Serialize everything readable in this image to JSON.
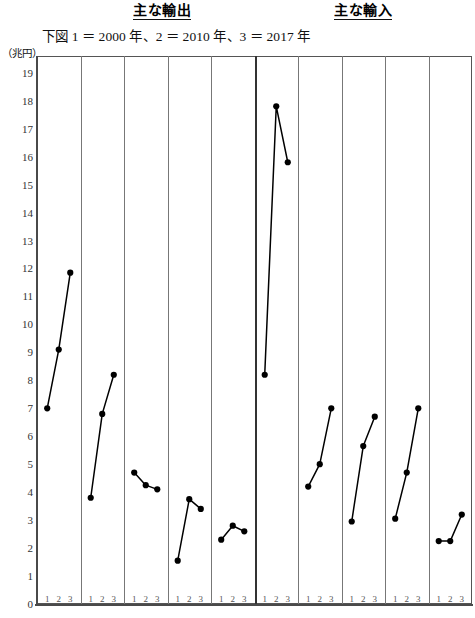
{
  "header": {
    "export_label": "主な輸出",
    "import_label": "主な輸入",
    "subnote": "下図 1 ＝ 2000 年、2 ＝ 2010 年、3 ＝ 2017 年",
    "unit_label": "（兆円）"
  },
  "chart_data": {
    "type": "line",
    "subtitle": "下図 1 ＝ 2000 年、2 ＝ 2010 年、3 ＝ 2017 年",
    "xlabel": "",
    "ylabel": "（兆円）",
    "ylim": [
      0,
      19.6
    ],
    "yticks": [
      0,
      1,
      2,
      3,
      4,
      5,
      6,
      7,
      8,
      9,
      10,
      11,
      12,
      13,
      14,
      15,
      16,
      17,
      18,
      19
    ],
    "grid": false,
    "legend": "none",
    "x": [
      "1",
      "2",
      "3"
    ],
    "x_meaning": [
      "2000年",
      "2010年",
      "2017年"
    ],
    "panel_tick_labels": [
      "1",
      "2",
      "3"
    ],
    "groups": [
      {
        "name": "主な輸出",
        "panels": [
          {
            "index": 1,
            "values": [
              7.0,
              9.1,
              11.85
            ]
          },
          {
            "index": 2,
            "values": [
              3.8,
              6.8,
              8.2
            ]
          },
          {
            "index": 3,
            "values": [
              4.7,
              4.25,
              4.1
            ]
          },
          {
            "index": 4,
            "values": [
              1.55,
              3.75,
              3.4
            ]
          },
          {
            "index": 5,
            "values": [
              2.3,
              2.8,
              2.6
            ]
          }
        ]
      },
      {
        "name": "主な輸入",
        "panels": [
          {
            "index": 6,
            "values": [
              8.2,
              17.8,
              15.8
            ]
          },
          {
            "index": 7,
            "values": [
              4.2,
              5.0,
              7.0
            ]
          },
          {
            "index": 8,
            "values": [
              2.95,
              5.65,
              6.7
            ]
          },
          {
            "index": 9,
            "values": [
              3.05,
              4.7,
              7.0
            ]
          },
          {
            "index": 10,
            "values": [
              2.25,
              2.25,
              3.2
            ]
          }
        ]
      }
    ],
    "series": [
      {
        "name": "panel-1",
        "values": [
          7.0,
          9.1,
          11.85
        ]
      },
      {
        "name": "panel-2",
        "values": [
          3.8,
          6.8,
          8.2
        ]
      },
      {
        "name": "panel-3",
        "values": [
          4.7,
          4.25,
          4.1
        ]
      },
      {
        "name": "panel-4",
        "values": [
          1.55,
          3.75,
          3.4
        ]
      },
      {
        "name": "panel-5",
        "values": [
          2.3,
          2.8,
          2.6
        ]
      },
      {
        "name": "panel-6",
        "values": [
          8.2,
          17.8,
          15.8
        ]
      },
      {
        "name": "panel-7",
        "values": [
          4.2,
          5.0,
          7.0
        ]
      },
      {
        "name": "panel-8",
        "values": [
          2.95,
          5.65,
          6.7
        ]
      },
      {
        "name": "panel-9",
        "values": [
          3.05,
          4.7,
          7.0
        ]
      },
      {
        "name": "panel-10",
        "values": [
          2.25,
          2.25,
          3.2
        ]
      }
    ],
    "colors": {
      "line": "#000000",
      "marker": "#000000",
      "frame": "#555555",
      "divider": "#777777"
    }
  }
}
